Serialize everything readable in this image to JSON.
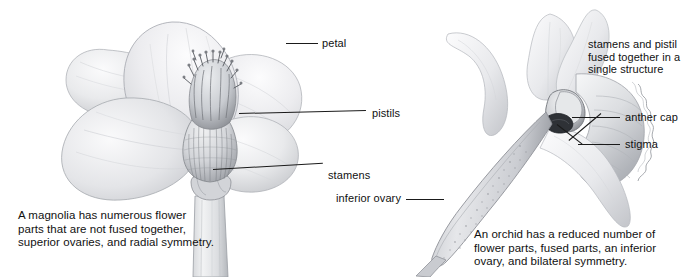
{
  "figure": {
    "kind": "botanical-comparison-diagram",
    "background_color": "#ffffff",
    "line_color": "#1a1a1a",
    "text_color": "#111111"
  },
  "magnolia": {
    "caption": "A magnolia has numerous flower\nparts that are not fused together,\nsuperior ovaries, and radial symmetry.",
    "labels": {
      "petal": "petal",
      "pistils": "pistils",
      "stamens": "stamens"
    }
  },
  "orchid": {
    "caption": "An orchid has a reduced number of\nflower parts, fused parts, an inferior\novary, and bilateral symmetry.",
    "labels": {
      "inferior_ovary": "inferior ovary",
      "column": "stamens and pistil\nfused together in a\nsingle structure",
      "anther_cap": "anther cap",
      "stigma": "stigma"
    }
  }
}
